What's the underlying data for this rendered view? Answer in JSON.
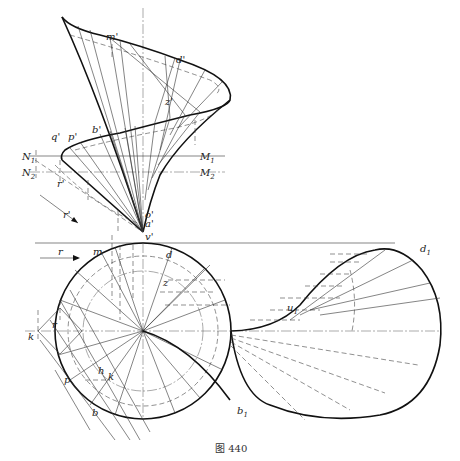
{
  "figure": {
    "caption": "图 440",
    "type": "descriptive-geometry drawing: helicoidal ruled surface, front view, top view and auxiliary development"
  },
  "labels": {
    "front_view": {
      "m": "m'",
      "d": "d'",
      "z": "z'",
      "b": "b'",
      "q": "q'",
      "p": "p'",
      "r": "r'",
      "r_arrow": "r'",
      "N1": "N",
      "N1_sub": "1",
      "N2": "N",
      "N2_sub": "2",
      "M1": "M",
      "M1_sub": "1",
      "M2": "M",
      "M2_sub": "2",
      "o": "o'",
      "a": "a'",
      "v": "v'"
    },
    "top_view": {
      "m": "m",
      "d": "d",
      "z": "z",
      "r_arrow": "r",
      "r": "r",
      "k": "k",
      "p": "p",
      "h": "h",
      "k2": "k",
      "b": "b"
    },
    "development": {
      "d1": "d",
      "d1_sub": "1",
      "u1": "u",
      "u1_sub": "1",
      "b1": "b",
      "b1_sub": "1"
    }
  },
  "colors": {
    "ink": "#111111",
    "background": "#ffffff"
  }
}
